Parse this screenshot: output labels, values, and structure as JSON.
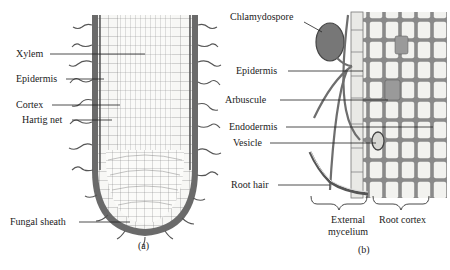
{
  "figure": {
    "panel_a": {
      "sublabel": "(a)",
      "labels": {
        "xylem": "Xylem",
        "epidermis": "Epidermis",
        "cortex": "Cortex",
        "hartig_net": "Hartig net",
        "fungal_sheath": "Fungal sheath"
      }
    },
    "panel_b": {
      "sublabel": "(b)",
      "labels": {
        "chlamydospore": "Chlamydospore",
        "epidermis": "Epidermis",
        "arbuscule": "Arbuscule",
        "endodermis": "Endodermis",
        "vesicle": "Vesicle",
        "root_hair": "Root hair",
        "external_mycelium_line1": "External",
        "external_mycelium_line2": "mycelium",
        "root_cortex": "Root cortex"
      }
    },
    "colors": {
      "ink": "#3a3a3a",
      "cell_fill": "#f7f7f5",
      "wall_fill": "#8a8a8a",
      "spore_fill": "#7a7a7a",
      "hypha": "#6e6e6e"
    }
  }
}
